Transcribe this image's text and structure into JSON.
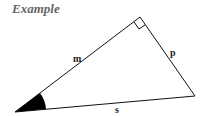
{
  "title": "Example",
  "diagram": {
    "type": "right-triangle",
    "vertices": {
      "acute_angle": [
        15,
        112
      ],
      "right_angle": [
        140,
        17
      ],
      "third": [
        195,
        96
      ]
    },
    "side_labels": {
      "hypotenuse_side_m": "m",
      "side_p": "p",
      "side_s": "s"
    },
    "marked_angle": "filled wedge at bottom-left vertex",
    "right_angle_marker": "square at top vertex",
    "colors": {
      "line": "#111111",
      "title": "#666666"
    }
  }
}
